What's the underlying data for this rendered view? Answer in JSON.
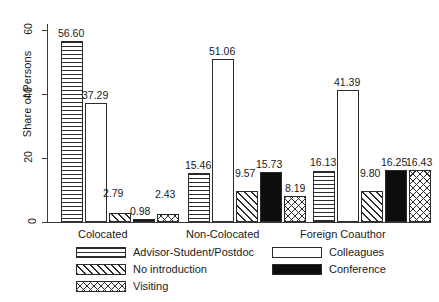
{
  "chart_data": {
    "type": "bar",
    "title": "",
    "subtitle": "",
    "xlabel": "",
    "ylabel": "Share of Persons",
    "categories": [
      "Colocated",
      "Non-Colocated",
      "Foreign Coauthor"
    ],
    "series": [
      {
        "name": "Advisor-Student/Postdoc",
        "pattern": "horizontal-lines",
        "values": [
          56.6,
          15.46,
          16.13
        ]
      },
      {
        "name": "Colleagues",
        "pattern": "empty-white",
        "values": [
          37.29,
          51.06,
          41.39
        ]
      },
      {
        "name": "No introduction",
        "pattern": "diagonal-stripes",
        "values": [
          2.79,
          9.57,
          9.8
        ]
      },
      {
        "name": "Conference",
        "pattern": "solid-black",
        "values": [
          0.98,
          15.73,
          16.25
        ]
      },
      {
        "name": "Visiting",
        "pattern": "crosshatch",
        "values": [
          2.43,
          8.19,
          16.43
        ]
      }
    ],
    "ylim": [
      0,
      62
    ],
    "yticks": [
      0,
      20,
      40,
      60
    ],
    "ytick_labels": [
      "0",
      "20",
      "40",
      "60"
    ],
    "grid": false,
    "legend_position": "bottom",
    "value_labels": [
      "56.60",
      "37.29",
      "2.79",
      "0.98",
      "2.43",
      "15.46",
      "51.06",
      "9.57",
      "15.73",
      "8.19",
      "16.13",
      "41.39",
      "9.80",
      "16.25",
      "16.43"
    ]
  },
  "axis": {
    "y_title": "Share of Persons",
    "ticks": [
      {
        "label": "60",
        "value": 60
      },
      {
        "label": "40",
        "value": 40
      },
      {
        "label": "20",
        "value": 20
      },
      {
        "label": "0",
        "value": 0
      }
    ]
  },
  "groups": [
    {
      "label": "Colocated",
      "bars": [
        {
          "series": "Advisor-Student/Postdoc",
          "value": 56.6,
          "label": "56.60",
          "pattern": "horizontal-lines"
        },
        {
          "series": "Colleagues",
          "value": 37.29,
          "label": "37.29",
          "pattern": "empty-white"
        },
        {
          "series": "No introduction",
          "value": 2.79,
          "label": "2.79",
          "pattern": "diagonal-stripes"
        },
        {
          "series": "Conference",
          "value": 0.98,
          "label": "0.98",
          "pattern": "solid-black"
        },
        {
          "series": "Visiting",
          "value": 2.43,
          "label": "2.43",
          "pattern": "crosshatch"
        }
      ]
    },
    {
      "label": "Non-Colocated",
      "bars": [
        {
          "series": "Advisor-Student/Postdoc",
          "value": 15.46,
          "label": "15.46",
          "pattern": "horizontal-lines"
        },
        {
          "series": "Colleagues",
          "value": 51.06,
          "label": "51.06",
          "pattern": "empty-white"
        },
        {
          "series": "No introduction",
          "value": 9.57,
          "label": "9.57",
          "pattern": "diagonal-stripes"
        },
        {
          "series": "Conference",
          "value": 15.73,
          "label": "15.73",
          "pattern": "solid-black"
        },
        {
          "series": "Visiting",
          "value": 8.19,
          "label": "8.19",
          "pattern": "crosshatch"
        }
      ]
    },
    {
      "label": "Foreign Coauthor",
      "bars": [
        {
          "series": "Advisor-Student/Postdoc",
          "value": 16.13,
          "label": "16.13",
          "pattern": "horizontal-lines"
        },
        {
          "series": "Colleagues",
          "value": 41.39,
          "label": "41.39",
          "pattern": "empty-white"
        },
        {
          "series": "No introduction",
          "value": 9.8,
          "label": "9.80",
          "pattern": "diagonal-stripes"
        },
        {
          "series": "Conference",
          "value": 16.25,
          "label": "16.25",
          "pattern": "solid-black"
        },
        {
          "series": "Visiting",
          "value": 16.43,
          "label": "16.43",
          "pattern": "crosshatch"
        }
      ]
    }
  ],
  "legend": {
    "left_column": [
      {
        "label": "Advisor-Student/Postdoc",
        "pattern": "horizontal-lines"
      },
      {
        "label": "No introduction",
        "pattern": "diagonal-stripes"
      },
      {
        "label": "Visiting",
        "pattern": "crosshatch"
      }
    ],
    "right_column": [
      {
        "label": "Colleagues",
        "pattern": "empty-white"
      },
      {
        "label": "Conference",
        "pattern": "solid-black"
      }
    ]
  },
  "colors": {
    "ink": "#2b2b2b",
    "background": "#ffffff",
    "solid_fill": "#0d0d0d"
  }
}
